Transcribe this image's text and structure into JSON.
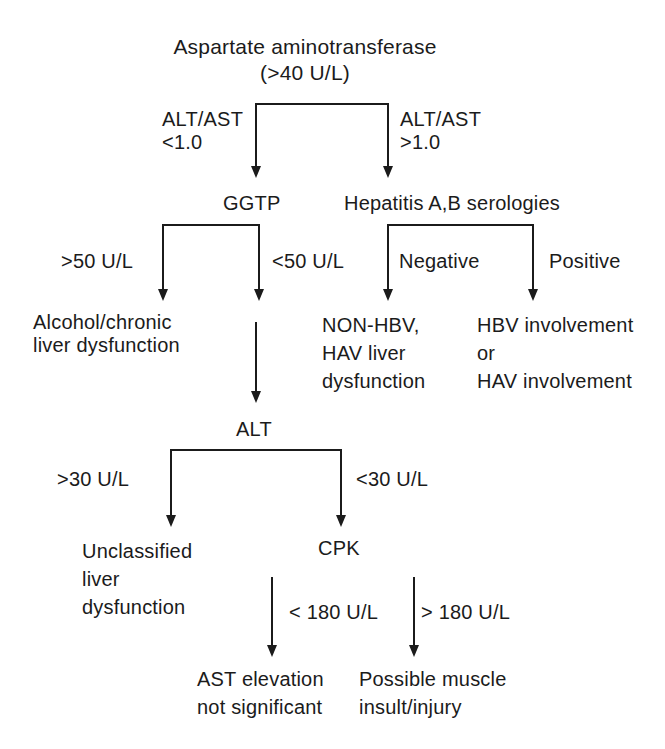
{
  "colors": {
    "ink": "#1b1b1b",
    "background": "#ffffff"
  },
  "flowchart": {
    "root": "Aspartate aminotransferase\n(>40 U/L)",
    "level1": {
      "left_condition": "ALT/AST\n<1.0",
      "right_condition": "ALT/AST\n>1.0"
    },
    "ggtp": {
      "node": "GGTP",
      "left_condition": ">50 U/L",
      "right_condition": "<50 U/L",
      "left_result": "Alcohol/chronic\nliver dysfunction"
    },
    "hepatitis": {
      "node": "Hepatitis A,B serologies",
      "left_condition": "Negative",
      "right_condition": "Positive",
      "negative_result": "NON-HBV,\nHAV liver\ndysfunction",
      "positive_result": "HBV involvement\nor\nHAV involvement"
    },
    "alt": {
      "node": "ALT",
      "left_condition": ">30 U/L",
      "right_condition": "<30 U/L",
      "left_result": "Unclassified\nliver\ndysfunction"
    },
    "cpk": {
      "node": "CPK",
      "left_condition": "< 180 U/L",
      "right_condition": "> 180 U/L",
      "left_result": "AST elevation\nnot significant",
      "right_result": "Possible muscle\ninsult/injury"
    }
  }
}
